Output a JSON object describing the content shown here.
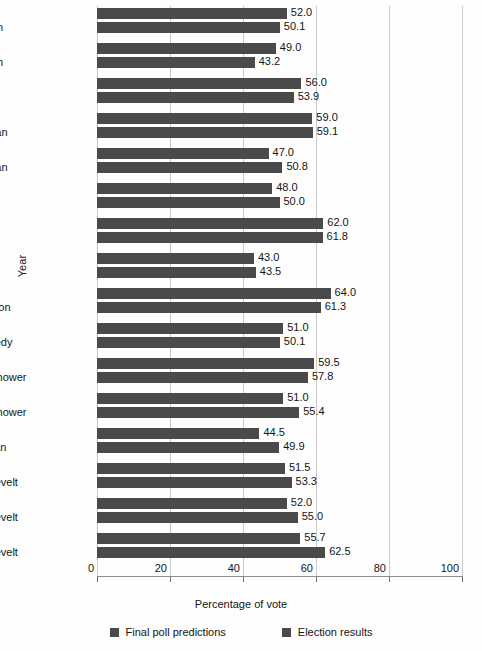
{
  "chart_data": {
    "type": "bar",
    "orientation": "horizontal",
    "title": "",
    "xlabel": "Percentage of vote",
    "ylabel": "Year",
    "xlim": [
      0,
      100
    ],
    "xticks": [
      0,
      20,
      40,
      60,
      80,
      100
    ],
    "grid": true,
    "legend_position": "bottom",
    "categories": [
      "1996 Clinton",
      "1992 Clinton",
      "1988 Bush",
      "1984 Reagan",
      "1980 Reagan",
      "1976 Carter",
      "1972 Nixon",
      "1968 Nixon",
      "1964 Johnson",
      "1960 Kennedy",
      "1956 Eisenhower",
      "1952 Eisenhower",
      "1948 Truman",
      "1944 Roosevelt",
      "1940 Roosevelt",
      "1936 Roosevelt"
    ],
    "category_parts": [
      {
        "year": "1996",
        "name": "Clinton"
      },
      {
        "year": "1992",
        "name": "Clinton"
      },
      {
        "year": "1988",
        "name": "Bush"
      },
      {
        "year": "1984",
        "name": "Reagan"
      },
      {
        "year": "1980",
        "name": "Reagan"
      },
      {
        "year": "1976",
        "name": "Carter"
      },
      {
        "year": "1972",
        "name": "Nixon"
      },
      {
        "year": "1968",
        "name": "Nixon"
      },
      {
        "year": "1964",
        "name": "Johnson"
      },
      {
        "year": "1960",
        "name": "Kennedy"
      },
      {
        "year": "1956",
        "name": "Eisenhower"
      },
      {
        "year": "1952",
        "name": "Eisenhower"
      },
      {
        "year": "1948",
        "name": "Truman"
      },
      {
        "year": "1944",
        "name": "Roosevelt"
      },
      {
        "year": "1940",
        "name": "Roosevelt"
      },
      {
        "year": "1936",
        "name": "Roosevelt"
      }
    ],
    "series": [
      {
        "name": "Final poll predictions",
        "color": "#4a4a4a",
        "values": [
          52.0,
          49.0,
          56.0,
          59.0,
          47.0,
          48.0,
          62.0,
          43.0,
          64.0,
          51.0,
          59.5,
          51.0,
          44.5,
          51.5,
          52.0,
          55.7
        ],
        "labels": [
          "52.0",
          "49.0",
          "56.0",
          "59.0",
          "47.0",
          "48.0",
          "62.0",
          "43.0",
          "64.0",
          "51.0",
          "59.5",
          "51.0",
          "44.5",
          "51.5",
          "52.0",
          "55.7"
        ]
      },
      {
        "name": "Election results",
        "color": "#4a4a4a",
        "values": [
          50.1,
          43.2,
          53.9,
          59.1,
          50.8,
          50.0,
          61.8,
          43.5,
          61.3,
          50.1,
          57.8,
          55.4,
          49.9,
          53.3,
          55.0,
          62.5
        ],
        "labels": [
          "50.1",
          "43.2",
          "53.9",
          "59.1",
          "50.8",
          "50.0",
          "61.8",
          "43.5",
          "61.3",
          "50.1",
          "57.8",
          "55.4",
          "49.9",
          "53.3",
          "55.0",
          "62.5"
        ]
      }
    ]
  },
  "axis": {
    "ylabel": "Year",
    "xlabel": "Percentage of vote",
    "xtick_labels": [
      "0",
      "20",
      "40",
      "60",
      "80",
      "100"
    ]
  },
  "legend": {
    "items": [
      {
        "label": "Final poll predictions",
        "color": "#4a4a4a"
      },
      {
        "label": "Election results",
        "color": "#4a4a4a"
      }
    ]
  },
  "colors": {
    "bar": "#4a4a4a",
    "grid": "#c9c9c9",
    "axis": "#8d8d8d",
    "text": "#141414",
    "background": "#fefefe"
  }
}
